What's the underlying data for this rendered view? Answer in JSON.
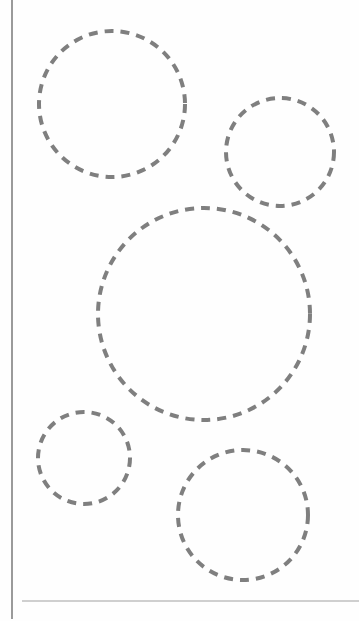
{
  "worksheet": {
    "stroke_color": "#7f7f7f",
    "stroke_width": 4,
    "dash": "9 7",
    "circles": [
      {
        "id": "circle-1",
        "cx": 112,
        "cy": 104,
        "r": 73
      },
      {
        "id": "circle-2",
        "cx": 280,
        "cy": 152,
        "r": 54
      },
      {
        "id": "circle-3",
        "cx": 204,
        "cy": 314,
        "r": 106
      },
      {
        "id": "circle-4",
        "cx": 84,
        "cy": 458,
        "r": 46
      },
      {
        "id": "circle-5",
        "cx": 243,
        "cy": 515,
        "r": 65
      }
    ]
  }
}
